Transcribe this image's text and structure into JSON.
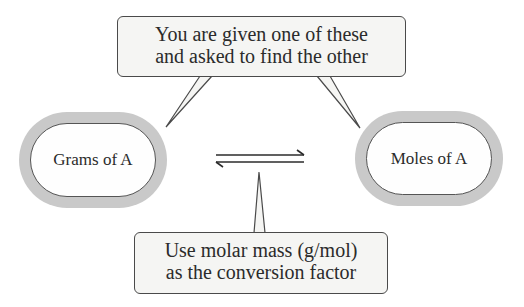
{
  "diagram": {
    "top_callout": {
      "lines": [
        "You are given one of these",
        "and asked to find the other"
      ]
    },
    "bottom_callout": {
      "lines": [
        "Use molar mass (g/mol)",
        "as the conversion factor"
      ]
    },
    "nodes": [
      {
        "id": "grams",
        "label": "Grams of A"
      },
      {
        "id": "moles",
        "label": "Moles of A"
      }
    ],
    "arrow": {
      "type": "equilibrium-double-harpoon",
      "symbol": "⇌"
    },
    "colors": {
      "ring": "#c9c9c9",
      "callout_fill": "#f5f5f3",
      "stroke": "#4a4a4a",
      "text": "#2b2b2b"
    }
  }
}
